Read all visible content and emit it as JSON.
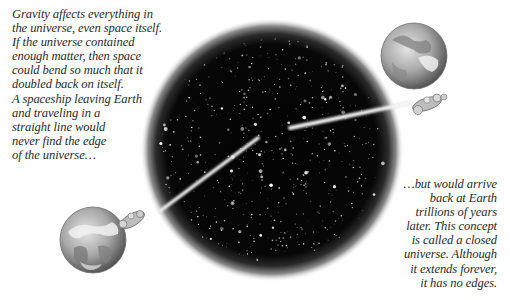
{
  "figure": {
    "type": "illustration",
    "palette": {
      "background": "#ffffff",
      "space": "#050505",
      "text": "#2a2a2a",
      "earth_light": "#d8d8d8",
      "earth_dark": "#6a6a6a"
    }
  },
  "cropped_top_text": "",
  "caption_left": {
    "lines": [
      "Gravity affects everything in",
      "the universe, even space itself.",
      "If the universe contained",
      "enough matter, then space",
      "could bend so much that it",
      "doubled back on itself.",
      "A spaceship leaving Earth",
      "and traveling in a",
      "straight line would",
      "never find the edge",
      "of the universe…"
    ]
  },
  "caption_right": {
    "lines": [
      "…but would arrive",
      "back at Earth",
      "trillions of years",
      "later. This concept",
      "is called a closed",
      "universe. Although",
      "it extends forever,",
      "it has no edges."
    ]
  },
  "illustration": {
    "universe_sphere": {
      "cx": 272,
      "cy": 150,
      "r": 118,
      "icon": "starfield-sphere"
    },
    "earth_departure": {
      "cx": 93,
      "cy": 240,
      "r": 33,
      "icon": "earth-globe"
    },
    "earth_arrival": {
      "cx": 414,
      "cy": 56,
      "r": 33,
      "icon": "earth-globe"
    },
    "trail_outbound": {
      "x1": 258,
      "y1": 138,
      "x2": 158,
      "y2": 212
    },
    "trail_return": {
      "x1": 290,
      "y1": 128,
      "x2": 408,
      "y2": 103
    },
    "spaceship_departure": {
      "x": 148,
      "y": 212,
      "icon": "spaceship"
    },
    "spaceship_arrival": {
      "x": 425,
      "y": 105,
      "icon": "spaceship"
    }
  }
}
